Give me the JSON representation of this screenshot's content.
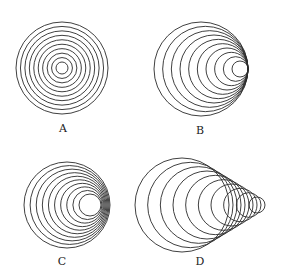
{
  "figure": {
    "stroke_color": "#2a2a2a",
    "panels": [
      {
        "id": "A",
        "label": "A",
        "label_pos": [
          63,
          128
        ],
        "arrangement": "concentric",
        "circle_count": 10,
        "outer": {
          "cx": 62,
          "cy": 68,
          "r": 46
        },
        "inner": {
          "cx": 62,
          "cy": 68,
          "r": 6
        }
      },
      {
        "id": "B",
        "label": "B",
        "label_pos": [
          200,
          130
        ],
        "arrangement": "internally tangent at right",
        "circle_count": 10,
        "outer": {
          "cx": 201,
          "cy": 69,
          "r": 47
        },
        "inner": {
          "cx": 240,
          "cy": 69,
          "r": 8
        }
      },
      {
        "id": "C",
        "label": "C",
        "label_pos": [
          62,
          261
        ],
        "arrangement": "nested, converging at right",
        "circle_count": 10,
        "outer": {
          "cx": 67,
          "cy": 205,
          "r": 43
        },
        "inner": {
          "cx": 90,
          "cy": 205,
          "r": 11
        }
      },
      {
        "id": "D",
        "label": "D",
        "label_pos": [
          200,
          261
        ],
        "arrangement": "overlapping cone",
        "circle_count": 10,
        "outer": {
          "cx": 182,
          "cy": 205,
          "r": 47
        },
        "inner": {
          "cx": 257,
          "cy": 205,
          "r": 8
        }
      }
    ]
  }
}
